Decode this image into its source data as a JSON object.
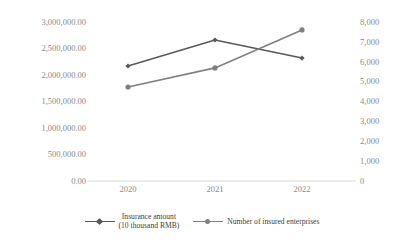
{
  "chart_data": {
    "type": "line",
    "title": "",
    "xlabel": "",
    "ylabel": "",
    "grid": false,
    "legend_position": "bottom",
    "categories": [
      "2020",
      "2021",
      "2022"
    ],
    "axes": {
      "x": {
        "tick_labels": [
          "2020",
          "2021",
          "2022"
        ]
      },
      "y_left": {
        "label": "Insurance amount (10 thousand RMB)",
        "ylim": [
          0,
          3000000
        ],
        "tick_labels": [
          "3,000,000.00",
          "2,500,000.00",
          "2,000,000.00",
          "1,500,000.00",
          "1,000,000.00",
          "500,000.00",
          "0.00"
        ],
        "tick_values": [
          3000000,
          2500000,
          2000000,
          1500000,
          1000000,
          500000,
          0
        ]
      },
      "y_right": {
        "label": "Number of insured enterprises",
        "ylim": [
          0,
          8000
        ],
        "tick_labels": [
          "8,000",
          "7,000",
          "6,000",
          "5,000",
          "4,000",
          "3,000",
          "2,000",
          "1,000",
          "0"
        ],
        "tick_values": [
          8000,
          7000,
          6000,
          5000,
          4000,
          3000,
          2000,
          1000,
          0
        ]
      }
    },
    "series": [
      {
        "name": "Insurance amount\n(10 thousand RMB)",
        "axis": "left",
        "color": "#595959",
        "marker": "diamond",
        "values": [
          2170000,
          2660000,
          2320000
        ]
      },
      {
        "name": "Number of insured enterprises",
        "axis": "right",
        "color": "#808080",
        "marker": "circle",
        "values": [
          4730,
          5690,
          7600
        ]
      }
    ]
  },
  "legend": {
    "items": [
      {
        "label": "Insurance amount\n(10 thousand RMB)",
        "color": "#595959"
      },
      {
        "label": "Number of insured enterprises",
        "color": "#808080"
      }
    ]
  },
  "colors": {
    "series_1": "#595959",
    "series_2": "#808080",
    "axis_line": "#d9d9d9",
    "tick_text": "#8a8a8a",
    "legend_text": "#3d3d3d",
    "background": "#ffffff"
  }
}
